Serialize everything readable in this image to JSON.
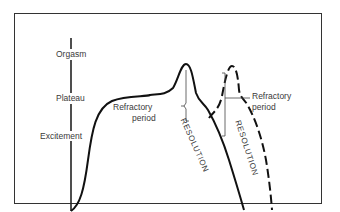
{
  "diagram": {
    "axis_labels": {
      "orgasm": "Orgasm",
      "plateau": "Plateau",
      "excitement": "Excitement"
    },
    "annotations": {
      "refractory_1_line1": "Refractory",
      "refractory_1_line2": "period",
      "refractory_2_line1": "Refractory",
      "refractory_2_line2": "period",
      "resolution_1": "RESOLUTION",
      "resolution_2": "RESOLUTION"
    },
    "colors": {
      "stroke": "#111111",
      "text": "#3a3a3a",
      "frame": "#333333"
    }
  }
}
